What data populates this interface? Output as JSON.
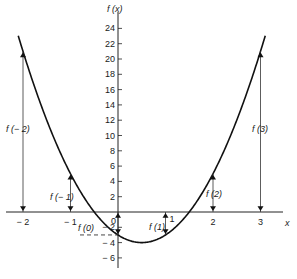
{
  "chart_data": {
    "type": "line",
    "title": "",
    "function": "f(x) = 4x^2 - 4x - 3",
    "xlabel": "x",
    "ylabel": "f (x)",
    "xlim": [
      -2.2,
      3.6
    ],
    "ylim": [
      -7,
      25
    ],
    "grid": false,
    "legend": null,
    "x_ticks": [
      -2,
      -1,
      0,
      1,
      2,
      3
    ],
    "x_tick_labels": [
      "− 2",
      "− 1",
      "0",
      "1",
      "2",
      "3"
    ],
    "y_ticks": [
      -6,
      -4,
      -2,
      2,
      4,
      6,
      8,
      10,
      12,
      14,
      16,
      18,
      20,
      22,
      24
    ],
    "y_tick_labels": [
      "− 6",
      "− 4",
      "− 2",
      "2",
      "4",
      "6",
      "8",
      "10",
      "12",
      "14",
      "16",
      "18",
      "20",
      "22",
      "24"
    ],
    "series": [
      {
        "name": "f(x)",
        "x": [
          -2.1,
          -2,
          -1.5,
          -1,
          -0.5,
          0,
          0.5,
          1,
          1.5,
          2,
          2.5,
          3,
          3.1
        ],
        "values": [
          23.04,
          21,
          12,
          5,
          0,
          -3,
          -4,
          -3,
          0,
          5,
          12,
          21,
          23.04
        ]
      }
    ],
    "annotations": [
      {
        "label": "f (− 2)",
        "x": -2,
        "value": 21
      },
      {
        "label": "f (− 1)",
        "x": -1,
        "value": 5
      },
      {
        "label": "f (0)",
        "x": 0,
        "value": -3
      },
      {
        "label": "f (1)",
        "x": 1,
        "value": -3
      },
      {
        "label": "f (2)",
        "x": 2,
        "value": 5
      },
      {
        "label": "f (3)",
        "x": 3,
        "value": 21
      }
    ],
    "x_axis_origin_label": "0"
  }
}
